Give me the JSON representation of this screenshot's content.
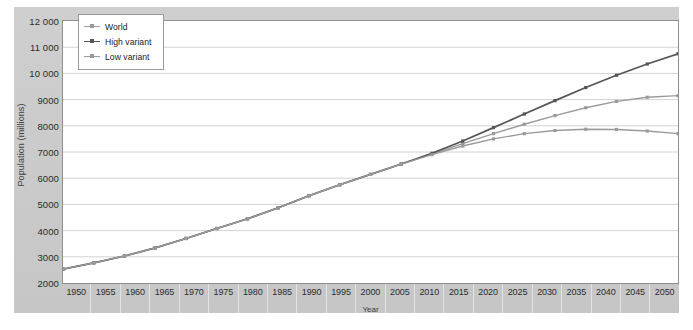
{
  "chart_data": {
    "type": "line",
    "title": "",
    "xlabel": "Year",
    "ylabel": "Population (millions)",
    "xlim": [
      1950,
      2050
    ],
    "ylim": [
      2000,
      12000
    ],
    "ytick_step": 1000,
    "grid": true,
    "legend_position": "top-left",
    "x": [
      1950,
      1955,
      1960,
      1965,
      1970,
      1975,
      1980,
      1985,
      1990,
      1995,
      2000,
      2005,
      2010,
      2015,
      2020,
      2025,
      2030,
      2035,
      2040,
      2045,
      2050
    ],
    "xtick_labels": [
      "1950",
      "1955",
      "1960",
      "1965",
      "1970",
      "1975",
      "1980",
      "1985",
      "1990",
      "1995",
      "2000",
      "2005",
      "2010",
      "2015",
      "2020",
      "2025",
      "2030",
      "2035",
      "2040",
      "2045",
      "2050"
    ],
    "ytick_labels": [
      "12 000",
      "11 000",
      "10 000",
      "9000",
      "8000",
      "7000",
      "6000",
      "5000",
      "4000",
      "3000",
      "2000"
    ],
    "ytick_values": [
      12000,
      11000,
      10000,
      9000,
      8000,
      7000,
      6000,
      5000,
      4000,
      3000,
      2000
    ],
    "series": [
      {
        "name": "World",
        "color": "#9a9a9a",
        "values": [
          2530,
          2770,
          3030,
          3340,
          3700,
          4080,
          4450,
          4870,
          5330,
          5750,
          6145,
          6540,
          6930,
          7320,
          7700,
          8060,
          8390,
          8690,
          8930,
          9090,
          9150
        ]
      },
      {
        "name": "High variant",
        "color": "#555555",
        "values": [
          2530,
          2770,
          3030,
          3340,
          3700,
          4080,
          4450,
          4870,
          5330,
          5750,
          6145,
          6540,
          6950,
          7420,
          7930,
          8450,
          8960,
          9460,
          9930,
          10360,
          10750
        ]
      },
      {
        "name": "Low variant",
        "color": "#9a9a9a",
        "values": [
          2530,
          2770,
          3030,
          3340,
          3700,
          4080,
          4450,
          4870,
          5330,
          5750,
          6145,
          6540,
          6900,
          7230,
          7500,
          7700,
          7820,
          7870,
          7860,
          7800,
          7700
        ]
      }
    ]
  },
  "legend": {
    "items": [
      {
        "label": "World",
        "color": "#9a9a9a",
        "marker": "square"
      },
      {
        "label": "High variant",
        "color": "#555555",
        "marker": "square"
      },
      {
        "label": "Low variant",
        "color": "#9a9a9a",
        "marker": "square"
      }
    ]
  },
  "axes": {
    "y_title": "Population (millions)",
    "x_title": "Year"
  }
}
